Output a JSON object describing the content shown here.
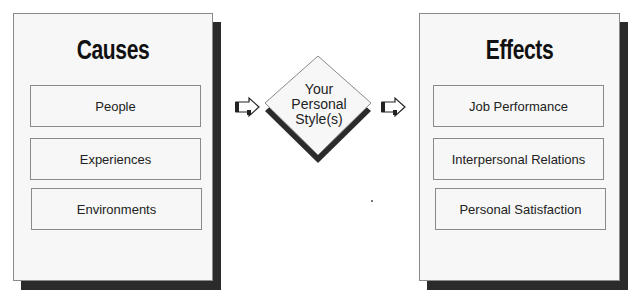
{
  "causes": {
    "title": "Causes",
    "items": [
      {
        "label": "People"
      },
      {
        "label": "Experiences"
      },
      {
        "label": "Environments"
      }
    ]
  },
  "center": {
    "lines": [
      "Your",
      "Personal",
      "Style(s)"
    ]
  },
  "effects": {
    "title": "Effects",
    "items": [
      {
        "label": "Job Performance"
      },
      {
        "label": "Interpersonal Relations"
      },
      {
        "label": "Personal Satisfaction"
      }
    ]
  },
  "arrows": [
    {
      "icon": "right-arrow-icon"
    },
    {
      "icon": "right-arrow-icon"
    }
  ],
  "colors": {
    "panel_fill": "#f7f7f7",
    "border": "#8a8a8a",
    "shadow": "#2b2b2b",
    "text": "#222222"
  }
}
